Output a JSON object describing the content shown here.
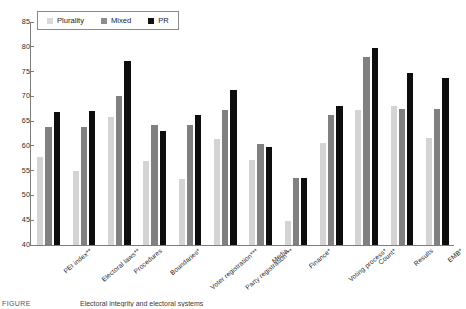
{
  "chart_data": {
    "type": "bar",
    "title": "",
    "xlabel": "",
    "ylabel": "",
    "ylim": [
      40,
      85
    ],
    "yticks": [
      40,
      45,
      50,
      55,
      60,
      65,
      70,
      75,
      80,
      85
    ],
    "grid": false,
    "legend_position": "top-left",
    "categories": [
      "PEI index**",
      "Electoral laws**",
      "Procedures",
      "Boundaries*",
      "Voter registration***",
      "Party registration***",
      "Media",
      "Finance*",
      "Voting process*",
      "Count*",
      "Results",
      "EMB*"
    ],
    "series": [
      {
        "name": "Plurality",
        "color": "#d4d4d4",
        "values": [
          57.7,
          55.0,
          65.9,
          57.0,
          53.3,
          61.3,
          57.2,
          44.8,
          60.5,
          67.3,
          68.0,
          61.5
        ]
      },
      {
        "name": "Mixed",
        "color": "#808080",
        "values": [
          63.8,
          63.9,
          70.0,
          64.2,
          64.2,
          67.2,
          60.3,
          53.6,
          66.2,
          78.0,
          67.4,
          67.4
        ]
      },
      {
        "name": "PR",
        "color": "#0d0d0d",
        "values": [
          66.9,
          67.0,
          77.1,
          63.0,
          66.2,
          71.3,
          59.7,
          53.6,
          68.0,
          79.7,
          74.7,
          73.7
        ]
      }
    ]
  },
  "caption": {
    "label": "FIGURE",
    "text": "Electoral integrity and electoral systems"
  }
}
